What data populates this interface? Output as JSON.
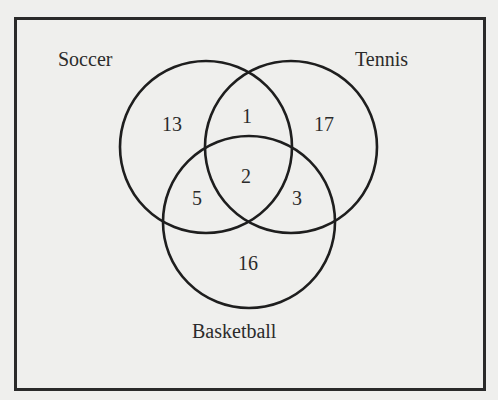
{
  "diagram": {
    "type": "venn",
    "sets": [
      {
        "name": "Soccer",
        "cx": 206,
        "cy": 147,
        "r": 86
      },
      {
        "name": "Tennis",
        "cx": 291,
        "cy": 147,
        "r": 86
      },
      {
        "name": "Basketball",
        "cx": 249,
        "cy": 222,
        "r": 86
      }
    ],
    "labels": {
      "soccer": "Soccer",
      "tennis": "Tennis",
      "basketball": "Basketball"
    },
    "regions": {
      "soccer_only": "13",
      "tennis_only": "17",
      "basketball_only": "16",
      "soccer_tennis_only": "1",
      "soccer_basketball_only": "5",
      "tennis_basketball_only": "3",
      "all_three": "2"
    },
    "colors": {
      "stroke": "#1e1e1e",
      "background": "#efefed",
      "text": "#2b2b2b"
    }
  }
}
